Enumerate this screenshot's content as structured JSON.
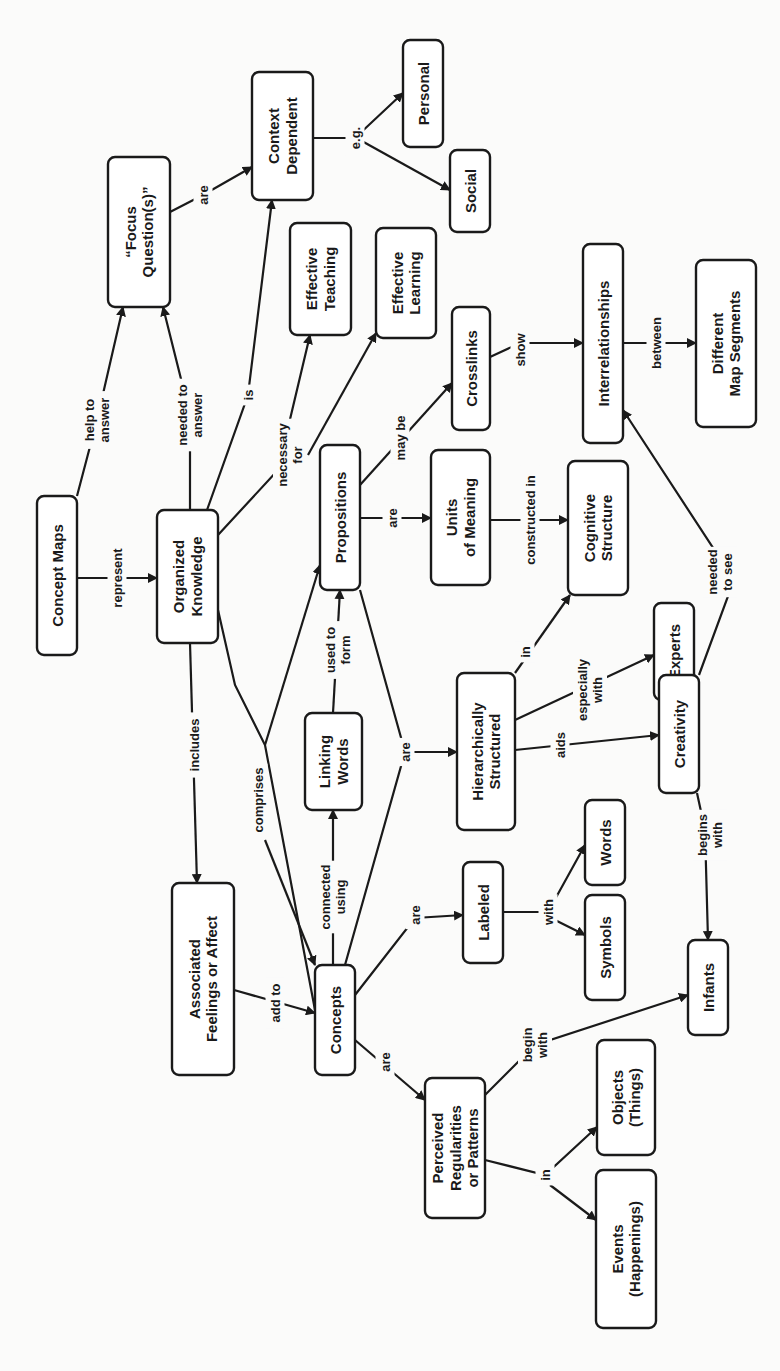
{
  "diagram": {
    "title": "Concept Maps",
    "orientation": "rotated-90-ccw",
    "colors": {
      "stroke": "#1a1a1a",
      "node_fill": "#ffffff",
      "background": "#fbfbfa"
    },
    "nodes": [
      {
        "id": "concept_maps",
        "lines": [
          "Concept Maps"
        ],
        "x": 37,
        "y": 496,
        "w": 40,
        "h": 159
      },
      {
        "id": "organized_knowledge",
        "lines": [
          "Organized",
          "Knowledge"
        ],
        "x": 157,
        "y": 510,
        "w": 61,
        "h": 133
      },
      {
        "id": "focus_questions",
        "lines": [
          "“Focus",
          "Question(s)”"
        ],
        "x": 108,
        "y": 157,
        "w": 62,
        "h": 150
      },
      {
        "id": "context_dependent",
        "lines": [
          "Context",
          "Dependent"
        ],
        "x": 252,
        "y": 72,
        "w": 61,
        "h": 128
      },
      {
        "id": "personal",
        "lines": [
          "Personal"
        ],
        "x": 403,
        "y": 40,
        "w": 40,
        "h": 107
      },
      {
        "id": "social",
        "lines": [
          "Social"
        ],
        "x": 450,
        "y": 150,
        "w": 40,
        "h": 82
      },
      {
        "id": "effective_teaching",
        "lines": [
          "Effective",
          "Teaching"
        ],
        "x": 290,
        "y": 223,
        "w": 61,
        "h": 112
      },
      {
        "id": "effective_learning",
        "lines": [
          "Effective",
          "Learning"
        ],
        "x": 376,
        "y": 228,
        "w": 60,
        "h": 110
      },
      {
        "id": "propositions",
        "lines": [
          "Propositions"
        ],
        "x": 320,
        "y": 445,
        "w": 40,
        "h": 145
      },
      {
        "id": "crosslinks",
        "lines": [
          "Crosslinks"
        ],
        "x": 452,
        "y": 307,
        "w": 38,
        "h": 123
      },
      {
        "id": "interrelationships",
        "lines": [
          "Interrelationships"
        ],
        "x": 583,
        "y": 244,
        "w": 40,
        "h": 199
      },
      {
        "id": "different_map_segments",
        "lines": [
          "Different",
          "Map Segments"
        ],
        "x": 696,
        "y": 260,
        "w": 60,
        "h": 167
      },
      {
        "id": "units_of_meaning",
        "lines": [
          "Units",
          "of Meaning"
        ],
        "x": 431,
        "y": 450,
        "w": 59,
        "h": 135
      },
      {
        "id": "cognitive_structure",
        "lines": [
          "Cognitive",
          "Structure"
        ],
        "x": 568,
        "y": 461,
        "w": 60,
        "h": 134
      },
      {
        "id": "experts",
        "lines": [
          "Experts"
        ],
        "x": 654,
        "y": 603,
        "w": 40,
        "h": 97
      },
      {
        "id": "hierarchically_structured",
        "lines": [
          "Hierarchically",
          "Structured"
        ],
        "x": 457,
        "y": 673,
        "w": 58,
        "h": 157
      },
      {
        "id": "creativity",
        "lines": [
          "Creativity"
        ],
        "x": 659,
        "y": 675,
        "w": 40,
        "h": 118
      },
      {
        "id": "linking_words",
        "lines": [
          "Linking",
          "Words"
        ],
        "x": 305,
        "y": 713,
        "w": 57,
        "h": 97
      },
      {
        "id": "labeled",
        "lines": [
          "Labeled"
        ],
        "x": 463,
        "y": 862,
        "w": 40,
        "h": 101
      },
      {
        "id": "words",
        "lines": [
          "Words"
        ],
        "x": 585,
        "y": 800,
        "w": 40,
        "h": 85
      },
      {
        "id": "symbols",
        "lines": [
          "Symbols"
        ],
        "x": 585,
        "y": 895,
        "w": 40,
        "h": 105
      },
      {
        "id": "infants",
        "lines": [
          "Infants"
        ],
        "x": 688,
        "y": 940,
        "w": 40,
        "h": 95
      },
      {
        "id": "associated_feelings",
        "lines": [
          "Associated",
          "Feelings or Affect"
        ],
        "x": 172,
        "y": 883,
        "w": 62,
        "h": 192
      },
      {
        "id": "concepts",
        "lines": [
          "Concepts"
        ],
        "x": 315,
        "y": 965,
        "w": 40,
        "h": 110
      },
      {
        "id": "perceived_regularities",
        "lines": [
          "Perceived",
          "Regularities",
          "or Patterns"
        ],
        "x": 425,
        "y": 1078,
        "w": 60,
        "h": 140
      },
      {
        "id": "objects",
        "lines": [
          "Objects",
          "(Things)"
        ],
        "x": 597,
        "y": 1040,
        "w": 58,
        "h": 115
      },
      {
        "id": "events",
        "lines": [
          "Events",
          "(Happenings)"
        ],
        "x": 596,
        "y": 1170,
        "w": 60,
        "h": 158
      }
    ],
    "edges": [
      {
        "from": [
          77,
          540
        ],
        "to": [
          157,
          578
        ],
        "label": [
          "represent"
        ],
        "lx": 117,
        "ly": 578,
        "points": [
          [
            77,
            578
          ],
          [
            157,
            578
          ]
        ],
        "arrow": true
      },
      {
        "from": [
          77,
          496
        ],
        "to": [
          123,
          307
        ],
        "label": [
          "help to",
          "answer"
        ],
        "lx": 97,
        "ly": 420,
        "points": [
          [
            77,
            496
          ],
          [
            97,
            420
          ],
          [
            123,
            307
          ]
        ],
        "arrow": true
      },
      {
        "from": [
          190,
          510
        ],
        "to": [
          163,
          307
        ],
        "label": [
          "needed to",
          "answer"
        ],
        "lx": 190,
        "ly": 415,
        "points": [
          [
            190,
            510
          ],
          [
            190,
            415
          ],
          [
            163,
            307
          ]
        ],
        "arrow": true
      },
      {
        "from": [
          207,
          510
        ],
        "to": [
          272,
          200
        ],
        "label": [
          "is"
        ],
        "lx": 248,
        "ly": 395,
        "points": [
          [
            207,
            510
          ],
          [
            248,
            395
          ],
          [
            272,
            200
          ]
        ],
        "arrow": true
      },
      {
        "from": [
          170,
          212
        ],
        "to": [
          252,
          167
        ],
        "label": [
          "are"
        ],
        "lx": 203,
        "ly": 195,
        "points": [
          [
            170,
            212
          ],
          [
            203,
            195
          ],
          [
            252,
            167
          ]
        ],
        "arrow": true
      },
      {
        "from": [
          313,
          138
        ],
        "to": [
          403,
          93
        ],
        "label": [
          "e.g."
        ],
        "lx": 355,
        "ly": 138,
        "points": [
          [
            313,
            138
          ],
          [
            355,
            138
          ],
          [
            403,
            93
          ]
        ],
        "arrow": true
      },
      {
        "from": [
          313,
          138
        ],
        "to": [
          450,
          190
        ],
        "label": [],
        "lx": 0,
        "ly": 0,
        "points": [
          [
            360,
            140
          ],
          [
            450,
            190
          ]
        ],
        "arrow": true
      },
      {
        "from": [
          218,
          535
        ],
        "to": [
          310,
          335
        ],
        "label": [
          "necessary",
          "for"
        ],
        "lx": 290,
        "ly": 455,
        "points": [
          [
            218,
            535
          ],
          [
            278,
            470
          ],
          [
            310,
            335
          ]
        ],
        "arrow": true
      },
      {
        "from": [
          308,
          455
        ],
        "to": [
          376,
          333
        ],
        "label": [],
        "lx": 0,
        "ly": 0,
        "points": [
          [
            308,
            455
          ],
          [
            376,
            333
          ]
        ],
        "arrow": true
      },
      {
        "from": [
          360,
          485
        ],
        "to": [
          452,
          383
        ],
        "label": [
          "may be"
        ],
        "lx": 400,
        "ly": 438,
        "points": [
          [
            360,
            485
          ],
          [
            452,
            383
          ]
        ],
        "arrow": true
      },
      {
        "from": [
          490,
          357
        ],
        "to": [
          583,
          343
        ],
        "label": [
          "show"
        ],
        "lx": 520,
        "ly": 350,
        "points": [
          [
            490,
            357
          ],
          [
            520,
            343
          ],
          [
            583,
            343
          ]
        ],
        "arrow": true
      },
      {
        "from": [
          623,
          343
        ],
        "to": [
          696,
          343
        ],
        "label": [
          "between"
        ],
        "lx": 656,
        "ly": 343,
        "points": [
          [
            623,
            343
          ],
          [
            696,
            343
          ]
        ],
        "arrow": true
      },
      {
        "from": [
          360,
          518
        ],
        "to": [
          431,
          518
        ],
        "label": [
          "are"
        ],
        "lx": 392,
        "ly": 518,
        "points": [
          [
            360,
            518
          ],
          [
            431,
            518
          ]
        ],
        "arrow": true
      },
      {
        "from": [
          490,
          520
        ],
        "to": [
          568,
          520
        ],
        "label": [
          "constructed in"
        ],
        "lx": 530,
        "ly": 520,
        "points": [
          [
            490,
            520
          ],
          [
            568,
            520
          ]
        ],
        "arrow": true
      },
      {
        "from": [
          515,
          673
        ],
        "to": [
          570,
          595
        ],
        "label": [
          "in"
        ],
        "lx": 525,
        "ly": 652,
        "points": [
          [
            515,
            673
          ],
          [
            570,
            595
          ]
        ],
        "arrow": true
      },
      {
        "from": [
          515,
          720
        ],
        "to": [
          654,
          655
        ],
        "label": [
          "especially",
          "with"
        ],
        "lx": 590,
        "ly": 690,
        "points": [
          [
            515,
            720
          ],
          [
            654,
            655
          ]
        ],
        "arrow": true
      },
      {
        "from": [
          515,
          750
        ],
        "to": [
          659,
          735
        ],
        "label": [
          "aids"
        ],
        "lx": 560,
        "ly": 745,
        "points": [
          [
            515,
            750
          ],
          [
            659,
            735
          ]
        ],
        "arrow": true
      },
      {
        "from": [
          699,
          675
        ],
        "to": [
          623,
          410
        ],
        "label": [
          "needed",
          "to see"
        ],
        "lx": 720,
        "ly": 572,
        "points": [
          [
            699,
            675
          ],
          [
            734,
            580
          ],
          [
            623,
            410
          ]
        ],
        "arrow": true
      },
      {
        "from": [
          697,
          793
        ],
        "to": [
          710,
          940
        ],
        "label": [
          "begins",
          "with"
        ],
        "lx": 710,
        "ly": 835,
        "points": [
          [
            697,
            793
          ],
          [
            705,
            830
          ],
          [
            708,
            940
          ]
        ],
        "arrow": true
      },
      {
        "from": [
          218,
          620
        ],
        "to": [
          315,
          1010
        ],
        "label": [
          "comprises"
        ],
        "lx": 258,
        "ly": 800,
        "points": [
          [
            218,
            610
          ],
          [
            235,
            685
          ],
          [
            265,
            745
          ],
          [
            315,
            1010
          ]
        ],
        "arrow": false
      },
      {
        "from": [
          265,
          745
        ],
        "to": [
          320,
          565
        ],
        "label": [],
        "lx": 0,
        "ly": 0,
        "points": [
          [
            265,
            745
          ],
          [
            320,
            565
          ]
        ],
        "arrow": true
      },
      {
        "from": [
          265,
          840
        ],
        "to": [
          315,
          965
        ],
        "label": [],
        "lx": 0,
        "ly": 0,
        "points": [
          [
            265,
            840
          ],
          [
            315,
            965
          ]
        ],
        "arrow": true
      },
      {
        "from": [
          190,
          643
        ],
        "to": [
          197,
          883
        ],
        "label": [
          "includes"
        ],
        "lx": 194,
        "ly": 745,
        "points": [
          [
            190,
            643
          ],
          [
            197,
            883
          ]
        ],
        "arrow": true
      },
      {
        "from": [
          333,
          713
        ],
        "to": [
          340,
          590
        ],
        "label": [
          "used to",
          "form"
        ],
        "lx": 338,
        "ly": 650,
        "points": [
          [
            333,
            713
          ],
          [
            340,
            590
          ]
        ],
        "arrow": true
      },
      {
        "from": [
          333,
          965
        ],
        "to": [
          333,
          810
        ],
        "label": [
          "connected",
          "using"
        ],
        "lx": 333,
        "ly": 897,
        "points": [
          [
            333,
            965
          ],
          [
            333,
            810
          ]
        ],
        "arrow": true
      },
      {
        "from": [
          345,
          965
        ],
        "to": [
          457,
          752
        ],
        "label": [
          "are"
        ],
        "lx": 405,
        "ly": 752,
        "points": [
          [
            360,
            590
          ],
          [
            405,
            752
          ],
          [
            345,
            965
          ]
        ],
        "arrow": false
      },
      {
        "from": [
          405,
          752
        ],
        "to": [
          457,
          752
        ],
        "label": [],
        "lx": 0,
        "ly": 0,
        "points": [
          [
            405,
            752
          ],
          [
            457,
            752
          ]
        ],
        "arrow": true
      },
      {
        "from": [
          234,
          990
        ],
        "to": [
          315,
          1013
        ],
        "label": [
          "add to"
        ],
        "lx": 275,
        "ly": 1003,
        "points": [
          [
            234,
            990
          ],
          [
            315,
            1013
          ]
        ],
        "arrow": true
      },
      {
        "from": [
          355,
          995
        ],
        "to": [
          463,
          915
        ],
        "label": [
          "are"
        ],
        "lx": 415,
        "ly": 915,
        "points": [
          [
            355,
            995
          ],
          [
            415,
            918
          ],
          [
            463,
            915
          ]
        ],
        "arrow": true
      },
      {
        "from": [
          503,
          912
        ],
        "to": [
          585,
          845
        ],
        "label": [
          "with"
        ],
        "lx": 548,
        "ly": 912,
        "points": [
          [
            503,
            912
          ],
          [
            548,
            912
          ],
          [
            585,
            845
          ]
        ],
        "arrow": true
      },
      {
        "from": [
          548,
          912
        ],
        "to": [
          585,
          935
        ],
        "label": [],
        "lx": 0,
        "ly": 0,
        "points": [
          [
            555,
            920
          ],
          [
            585,
            935
          ]
        ],
        "arrow": true
      },
      {
        "from": [
          355,
          1040
        ],
        "to": [
          425,
          1100
        ],
        "label": [
          "are"
        ],
        "lx": 385,
        "ly": 1062,
        "points": [
          [
            355,
            1040
          ],
          [
            425,
            1100
          ]
        ],
        "arrow": true
      },
      {
        "from": [
          485,
          1095
        ],
        "to": [
          688,
          995
        ],
        "label": [
          "begin",
          "with"
        ],
        "lx": 535,
        "ly": 1045,
        "points": [
          [
            485,
            1095
          ],
          [
            535,
            1045
          ],
          [
            688,
            995
          ]
        ],
        "arrow": true
      },
      {
        "from": [
          485,
          1160
        ],
        "to": [
          597,
          1127
        ],
        "label": [
          "in"
        ],
        "lx": 545,
        "ly": 1175,
        "points": [
          [
            485,
            1160
          ],
          [
            545,
            1175
          ],
          [
            597,
            1127
          ]
        ],
        "arrow": true
      },
      {
        "from": [
          545,
          1175
        ],
        "to": [
          596,
          1220
        ],
        "label": [],
        "lx": 0,
        "ly": 0,
        "points": [
          [
            550,
            1185
          ],
          [
            596,
            1220
          ]
        ],
        "arrow": true
      }
    ]
  }
}
